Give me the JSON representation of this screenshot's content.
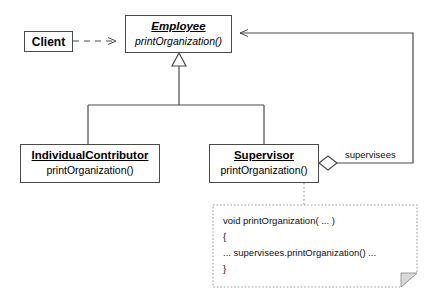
{
  "diagram": {
    "type": "uml-class-diagram",
    "colors": {
      "stroke": "#4a4a4a",
      "text": "#000000",
      "background": "#ffffff",
      "note_stroke": "#9a9a9a"
    },
    "classes": [
      {
        "id": "client",
        "name": "Client",
        "abstract": false,
        "operations": []
      },
      {
        "id": "employee",
        "name": "Employee",
        "abstract": true,
        "operations": [
          "printOrganization()"
        ]
      },
      {
        "id": "individual_contributor",
        "name": "IndividualContributor",
        "abstract": false,
        "operations": [
          "printOrganization()"
        ]
      },
      {
        "id": "supervisor",
        "name": "Supervisor",
        "abstract": false,
        "operations": [
          "printOrganization()"
        ]
      }
    ],
    "relationships": [
      {
        "id": "client-employee",
        "kind": "dependency",
        "style": "dashed",
        "from": "client",
        "to": "employee",
        "label": ""
      },
      {
        "id": "ic-employee",
        "kind": "generalization",
        "style": "solid",
        "from": "individual_contributor",
        "to": "employee",
        "label": ""
      },
      {
        "id": "supervisor-employee-inherit",
        "kind": "generalization",
        "style": "solid",
        "from": "supervisor",
        "to": "employee",
        "label": ""
      },
      {
        "id": "supervisor-employee-aggregation",
        "kind": "aggregation",
        "style": "solid",
        "from": "supervisor",
        "to": "employee",
        "label": "supervisees"
      }
    ],
    "edge_labels": {
      "supervisees": "supervisees"
    },
    "note": {
      "id": "supervisor-note",
      "attached_to": "supervisor",
      "connector_style": "dotted",
      "lines": [
        "void printOrganization( ... )",
        "{",
        "... supervisees.printOrganization() ...",
        "}"
      ]
    }
  }
}
